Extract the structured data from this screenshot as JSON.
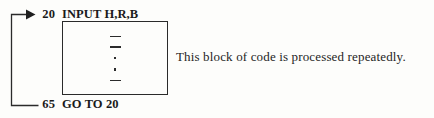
{
  "figure": {
    "background_color": "#fdfdfb",
    "ink_color": "#1c1c1c"
  },
  "program": {
    "top_line": {
      "number": "20",
      "statement": "INPUT H,R,B"
    },
    "bottom_line": {
      "number": "65",
      "statement": "GO TO 20"
    }
  },
  "repeated_block": {
    "marks": [
      "dash",
      "dash",
      "dot",
      "dot",
      "dash"
    ]
  },
  "loop_arrow": {
    "label": "loop-back-arrow",
    "target": "20"
  },
  "annotation": {
    "text": "This block of code is processed repeatedly."
  }
}
